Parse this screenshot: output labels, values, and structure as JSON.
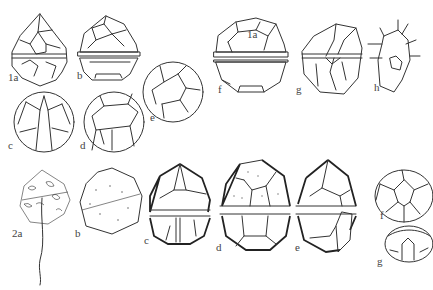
{
  "figure": {
    "groups": [
      {
        "number": "1",
        "panels": [
          {
            "id": "1a",
            "label": "1a",
            "view": "ventral view, pointed apex, plated theca with cingulum"
          },
          {
            "id": "1b",
            "label": "b",
            "view": "side view with wide cingulum band"
          },
          {
            "id": "1c",
            "label": "c",
            "view": "ventral epitheca/sulcus, rounded"
          },
          {
            "id": "1d",
            "label": "d",
            "view": "rounded plated cell"
          },
          {
            "id": "1e",
            "label": "e",
            "view": "circular apical/antapical view"
          },
          {
            "id": "1f",
            "label": "f",
            "view": "cell with plate annotated 1a, wide cingulum"
          },
          {
            "id": "1f-plate",
            "label": "1a",
            "view": "plate label inside figure f"
          },
          {
            "id": "1g",
            "label": "g",
            "view": "oblique view with sulcus"
          },
          {
            "id": "1h",
            "label": "h",
            "view": "detail of sulcal plates with lines"
          }
        ]
      },
      {
        "number": "2",
        "panels": [
          {
            "id": "2a",
            "label": "2a",
            "view": "stippled cell with long flagellum"
          },
          {
            "id": "2b",
            "label": "b",
            "view": "stippled cell, oblique"
          },
          {
            "id": "2c",
            "label": "c",
            "view": "shaded theca, ventral, with sulcus"
          },
          {
            "id": "2d",
            "label": "d",
            "view": "theca with punctate plates"
          },
          {
            "id": "2e",
            "label": "e",
            "view": "theca lateral view with sulcus flap"
          },
          {
            "id": "2f",
            "label": "f",
            "view": "apical view, plate pattern"
          },
          {
            "id": "2g",
            "label": "g",
            "view": "antapical/oblique small view"
          }
        ]
      }
    ]
  }
}
